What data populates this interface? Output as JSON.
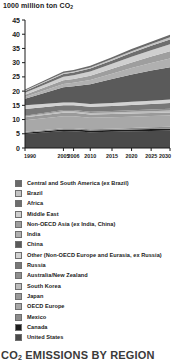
{
  "chart": {
    "axis_title": "1000 million ton CO",
    "axis_title_sub": "2",
    "footer": "CO",
    "footer_sub": "2",
    "footer_rest": " EMISSIONS BY REGION"
  },
  "chart_data": {
    "type": "area",
    "title": "1000 million ton CO2",
    "subtitle": "CO2 EMISSIONS BY REGION",
    "xlabel": "",
    "ylabel": "1000 million ton CO2",
    "x": [
      1990,
      2005,
      2006,
      2010,
      2015,
      2020,
      2025,
      2030
    ],
    "xtick_labels": [
      "1990",
      "2005",
      "2006",
      "2010",
      "2015",
      "2020",
      "2025",
      "2030"
    ],
    "ylim": [
      0,
      45
    ],
    "ytick_labels": [
      "0",
      "5",
      "10",
      "15",
      "20",
      "25",
      "30",
      "35",
      "40",
      "45"
    ],
    "yticks": [
      0,
      5,
      10,
      15,
      20,
      25,
      30,
      35,
      40,
      45
    ],
    "grid": false,
    "legend_position": "below",
    "stacked": true,
    "stack_order_bottom_to_top": [
      "United States",
      "Canada",
      "Mexico",
      "OECD Europe",
      "Japan",
      "South Korea",
      "Australia/New Zealand",
      "Russia",
      "Other (Non-OECD Europe and Eurasia, ex Russia)",
      "China",
      "India",
      "Non-OECD Asia (ex India, China)",
      "Middle East",
      "Africa",
      "Brazil",
      "Central and South America (ex Brazil)"
    ],
    "series": [
      {
        "name": "United States",
        "color": "#4a4a4a",
        "values": [
          4.95,
          5.95,
          5.9,
          5.55,
          5.7,
          5.85,
          6.0,
          6.15
        ]
      },
      {
        "name": "Canada",
        "color": "#1c1c1c",
        "values": [
          0.45,
          0.58,
          0.58,
          0.56,
          0.6,
          0.62,
          0.64,
          0.66
        ]
      },
      {
        "name": "Mexico",
        "color": "#8c8c8c",
        "values": [
          0.3,
          0.42,
          0.43,
          0.44,
          0.5,
          0.56,
          0.62,
          0.68
        ]
      },
      {
        "name": "OECD Europe",
        "color": "#a8a8a8",
        "values": [
          4.05,
          4.25,
          4.25,
          4.05,
          4.0,
          3.98,
          3.96,
          3.95
        ]
      },
      {
        "name": "Japan",
        "color": "#9a9a9a",
        "values": [
          1.05,
          1.22,
          1.22,
          1.15,
          1.12,
          1.1,
          1.08,
          1.05
        ]
      },
      {
        "name": "South Korea",
        "color": "#bdbdbd",
        "values": [
          0.24,
          0.5,
          0.51,
          0.54,
          0.58,
          0.62,
          0.66,
          0.7
        ]
      },
      {
        "name": "Australia/New Zealand",
        "color": "#8f8f8f",
        "values": [
          0.28,
          0.42,
          0.43,
          0.45,
          0.48,
          0.51,
          0.54,
          0.57
        ]
      },
      {
        "name": "Russia",
        "color": "#787878",
        "values": [
          2.35,
          1.7,
          1.72,
          1.72,
          1.8,
          1.88,
          1.95,
          2.02
        ]
      },
      {
        "name": "Other (Non-OECD Europe and Eurasia, ex Russia)",
        "color": "#d2d2d2",
        "values": [
          1.35,
          0.95,
          0.96,
          0.98,
          1.05,
          1.12,
          1.18,
          1.25
        ]
      },
      {
        "name": "China",
        "color": "#5a5a5a",
        "values": [
          2.3,
          5.35,
          5.7,
          7.0,
          8.4,
          9.6,
          10.6,
          11.4
        ]
      },
      {
        "name": "India",
        "color": "#b0b0b0",
        "values": [
          0.6,
          1.15,
          1.2,
          1.45,
          1.85,
          2.25,
          2.65,
          3.05
        ]
      },
      {
        "name": "Non-OECD Asia (ex India, China)",
        "color": "#9e9e9e",
        "values": [
          0.78,
          1.3,
          1.34,
          1.5,
          1.75,
          2.0,
          2.25,
          2.5
        ]
      },
      {
        "name": "Middle East",
        "color": "#cfcfcf",
        "values": [
          0.68,
          1.28,
          1.32,
          1.5,
          1.75,
          2.0,
          2.25,
          2.48
        ]
      },
      {
        "name": "Africa",
        "color": "#6e6e6e",
        "values": [
          0.62,
          0.95,
          0.97,
          1.05,
          1.2,
          1.38,
          1.55,
          1.72
        ]
      },
      {
        "name": "Brazil",
        "color": "#c4c4c4",
        "values": [
          0.21,
          0.34,
          0.35,
          0.4,
          0.48,
          0.56,
          0.64,
          0.72
        ]
      },
      {
        "name": "Central and South America (ex Brazil)",
        "color": "#6a6a6a",
        "values": [
          0.34,
          0.52,
          0.53,
          0.58,
          0.66,
          0.74,
          0.82,
          0.9
        ]
      }
    ],
    "totals": [
      20.85,
      26.88,
      27.41,
      28.92,
      31.92,
      34.77,
      37.39,
      39.8
    ]
  },
  "legend": {
    "items": [
      {
        "label": "Central and South America (ex Brazil)",
        "color": "#6a6a6a"
      },
      {
        "label": "Brazil",
        "color": "#c4c4c4"
      },
      {
        "label": "Africa",
        "color": "#6e6e6e"
      },
      {
        "label": "Middle East",
        "color": "#cfcfcf"
      },
      {
        "label": "Non-OECD Asia (ex India, China)",
        "color": "#9e9e9e"
      },
      {
        "label": "India",
        "color": "#b0b0b0"
      },
      {
        "label": "China",
        "color": "#5a5a5a"
      },
      {
        "label": "Other (Non-OECD Europe and Eurasia, ex Russia)",
        "color": "#d2d2d2"
      },
      {
        "label": "Russia",
        "color": "#787878"
      },
      {
        "label": "Australia/New Zealand",
        "color": "#8f8f8f"
      },
      {
        "label": "South Korea",
        "color": "#bdbdbd"
      },
      {
        "label": "Japan",
        "color": "#9a9a9a"
      },
      {
        "label": "OECD Europe",
        "color": "#a8a8a8"
      },
      {
        "label": "Mexico",
        "color": "#8c8c8c"
      },
      {
        "label": "Canada",
        "color": "#1c1c1c"
      },
      {
        "label": "United States",
        "color": "#4a4a4a"
      }
    ]
  }
}
